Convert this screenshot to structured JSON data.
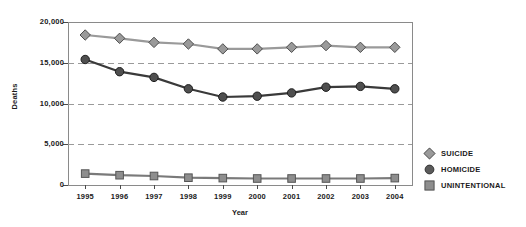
{
  "chart_data": {
    "type": "line",
    "title": "",
    "xlabel": "Year",
    "ylabel": "Deaths",
    "categories": [
      "1995",
      "1996",
      "1997",
      "1998",
      "1999",
      "2000",
      "2001",
      "2002",
      "2003",
      "2004"
    ],
    "x": [
      1995,
      1996,
      1997,
      1998,
      1999,
      2000,
      2001,
      2002,
      2003,
      2004
    ],
    "ylim": [
      0,
      20000
    ],
    "yticks": [
      0,
      5000,
      10000,
      15000,
      20000
    ],
    "ytick_labels": [
      "0",
      "5,000",
      "10,000",
      "15,000",
      "20,000"
    ],
    "grid": "horizontal-dashed",
    "legend_position": "right-outside",
    "series": [
      {
        "name": "SUICIDE",
        "marker": "diamond",
        "color": "#9a9a9a",
        "line_color": "#9a9a9a",
        "edge_color": "#4d4d4d",
        "values": [
          18400,
          18000,
          17500,
          17300,
          16700,
          16700,
          16900,
          17100,
          16900,
          16900
        ]
      },
      {
        "name": "HOMICIDE",
        "marker": "circle",
        "color": "#4f4f4f",
        "line_color": "#3a3a3a",
        "edge_color": "#1e1e1e",
        "values": [
          15400,
          13900,
          13200,
          11800,
          10800,
          10900,
          11300,
          12000,
          12100,
          11800
        ]
      },
      {
        "name": "UNINTENTIONAL",
        "marker": "square",
        "color": "#8e8e8e",
        "line_color": "#7a7a7a",
        "edge_color": "#565656",
        "values": [
          1400,
          1200,
          1100,
          900,
          850,
          800,
          800,
          800,
          800,
          850
        ]
      }
    ]
  },
  "legend": {
    "items": [
      {
        "label": "SUICIDE",
        "marker": "diamond"
      },
      {
        "label": "HOMICIDE",
        "marker": "circle"
      },
      {
        "label": "UNINTENTIONAL",
        "marker": "square"
      }
    ]
  },
  "axes": {
    "y_title": "Deaths",
    "x_title": "Year"
  },
  "colors": {
    "frame": "#8a8a8a",
    "gridline": "#9a9a9a",
    "text": "#1a1a1a",
    "background": "#ffffff"
  }
}
